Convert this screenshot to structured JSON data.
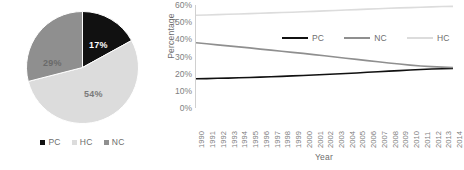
{
  "colors": {
    "pc": "#111111",
    "nc": "#8f8f8f",
    "hc": "#dcdcdc",
    "axis": "#d0d0d0",
    "text": "#6d6d6d",
    "tick": "#808080",
    "background": "#ffffff"
  },
  "pie": {
    "legend": [
      {
        "label": "PC",
        "color": "#111111"
      },
      {
        "label": "HC",
        "color": "#dcdcdc"
      },
      {
        "label": "NC",
        "color": "#8f8f8f"
      }
    ],
    "labels": {
      "pc": "17%",
      "hc": "54%",
      "nc": "29%"
    }
  },
  "line": {
    "ytitle": "Percentage",
    "xtitle": "Year",
    "legend": [
      {
        "label": "PC",
        "color": "#111111"
      },
      {
        "label": "NC",
        "color": "#8f8f8f"
      },
      {
        "label": "HC",
        "color": "#dcdcdc"
      }
    ]
  },
  "chart_data": [
    {
      "type": "pie",
      "title": "",
      "categories": [
        "PC",
        "HC",
        "NC"
      ],
      "values": [
        17,
        54,
        29
      ],
      "value_labels": [
        "17%",
        "54%",
        "29%"
      ],
      "colors": [
        "#111111",
        "#dcdcdc",
        "#8f8f8f"
      ],
      "legend": "bottom",
      "start_angle_deg": 0,
      "direction": "clockwise"
    },
    {
      "type": "line",
      "title": "",
      "xlabel": "Year",
      "ylabel": "Percentage",
      "ylim": [
        0,
        60
      ],
      "yticks": [
        0,
        10,
        20,
        30,
        40,
        50,
        60
      ],
      "ytick_labels": [
        "0%",
        "10%",
        "20%",
        "30%",
        "40%",
        "50%",
        "60%"
      ],
      "grid": false,
      "legend": "inside-top",
      "x": [
        1990,
        1991,
        1992,
        1993,
        1994,
        1995,
        1996,
        1997,
        1998,
        1999,
        2000,
        2001,
        2002,
        2003,
        2004,
        2005,
        2006,
        2007,
        2008,
        2009,
        2010,
        2011,
        2012,
        2013,
        2014
      ],
      "series": [
        {
          "name": "PC",
          "color": "#111111",
          "values": [
            17.0,
            17.1,
            17.3,
            17.4,
            17.6,
            17.8,
            18.0,
            18.2,
            18.4,
            18.7,
            18.9,
            19.2,
            19.5,
            19.8,
            20.1,
            20.4,
            20.8,
            21.1,
            21.5,
            21.8,
            22.1,
            22.4,
            22.7,
            22.9,
            23.1
          ]
        },
        {
          "name": "NC",
          "color": "#8f8f8f",
          "values": [
            38.0,
            37.4,
            36.8,
            36.2,
            35.6,
            35.0,
            34.3,
            33.7,
            33.1,
            32.4,
            31.8,
            31.1,
            30.4,
            29.7,
            29.0,
            28.3,
            27.6,
            26.9,
            26.2,
            25.6,
            25.0,
            24.5,
            24.1,
            23.8,
            23.6
          ]
        },
        {
          "name": "HC",
          "color": "#dcdcdc",
          "values": [
            54.0,
            54.2,
            54.4,
            54.6,
            54.8,
            55.0,
            55.2,
            55.4,
            55.6,
            55.8,
            56.1,
            56.3,
            56.6,
            56.8,
            57.1,
            57.3,
            57.6,
            57.8,
            58.1,
            58.3,
            58.5,
            58.7,
            58.9,
            59.1,
            59.2
          ]
        }
      ]
    }
  ]
}
